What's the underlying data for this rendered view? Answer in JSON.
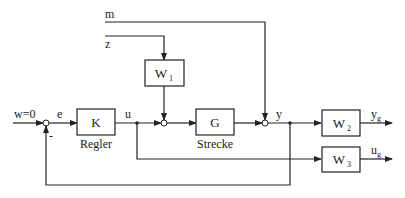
{
  "diagram": {
    "inputs": {
      "reference": "w=0",
      "measurement_noise": "m",
      "disturbance": "z"
    },
    "signals": {
      "error": "e",
      "control": "u",
      "output": "y",
      "feedback_sign": "-"
    },
    "blocks": {
      "controller": {
        "symbol": "K",
        "caption": "Regler"
      },
      "plant": {
        "symbol": "G",
        "caption": "Strecke"
      },
      "w1": {
        "symbol": "W",
        "subscript": "1"
      },
      "w2": {
        "symbol": "W",
        "subscript": "2"
      },
      "w3": {
        "symbol": "W",
        "subscript": "3"
      }
    },
    "outputs": {
      "yg": {
        "symbol": "y",
        "subscript": "g"
      },
      "ug": {
        "symbol": "u",
        "subscript": "g"
      }
    }
  }
}
